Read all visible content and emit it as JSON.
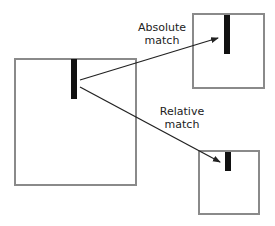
{
  "diagram": {
    "source": {
      "name": "source-frame",
      "x": 14,
      "y": 58,
      "w": 123,
      "h": 128,
      "bar": {
        "x": 71,
        "y": 59,
        "w": 6,
        "h": 40
      }
    },
    "targets": [
      {
        "name": "absolute-match-frame",
        "x": 192,
        "y": 13,
        "w": 73,
        "h": 76,
        "bar": {
          "x": 224,
          "y": 15,
          "w": 6,
          "h": 39
        }
      },
      {
        "name": "relative-match-frame",
        "x": 198,
        "y": 150,
        "w": 62,
        "h": 65,
        "bar": {
          "x": 225,
          "y": 152,
          "w": 6,
          "h": 19
        }
      }
    ],
    "arrows": [
      {
        "label_line1": "Absolute",
        "label_line2": "match",
        "from": [
          80,
          80
        ],
        "to": [
          218,
          38
        ]
      },
      {
        "label_line1": "Relative",
        "label_line2": "match",
        "from": [
          80,
          87
        ],
        "to": [
          220,
          162
        ]
      }
    ],
    "colors": {
      "frame_border": "#8a8a8a",
      "bar": "#111111",
      "arrow": "#222222"
    }
  }
}
